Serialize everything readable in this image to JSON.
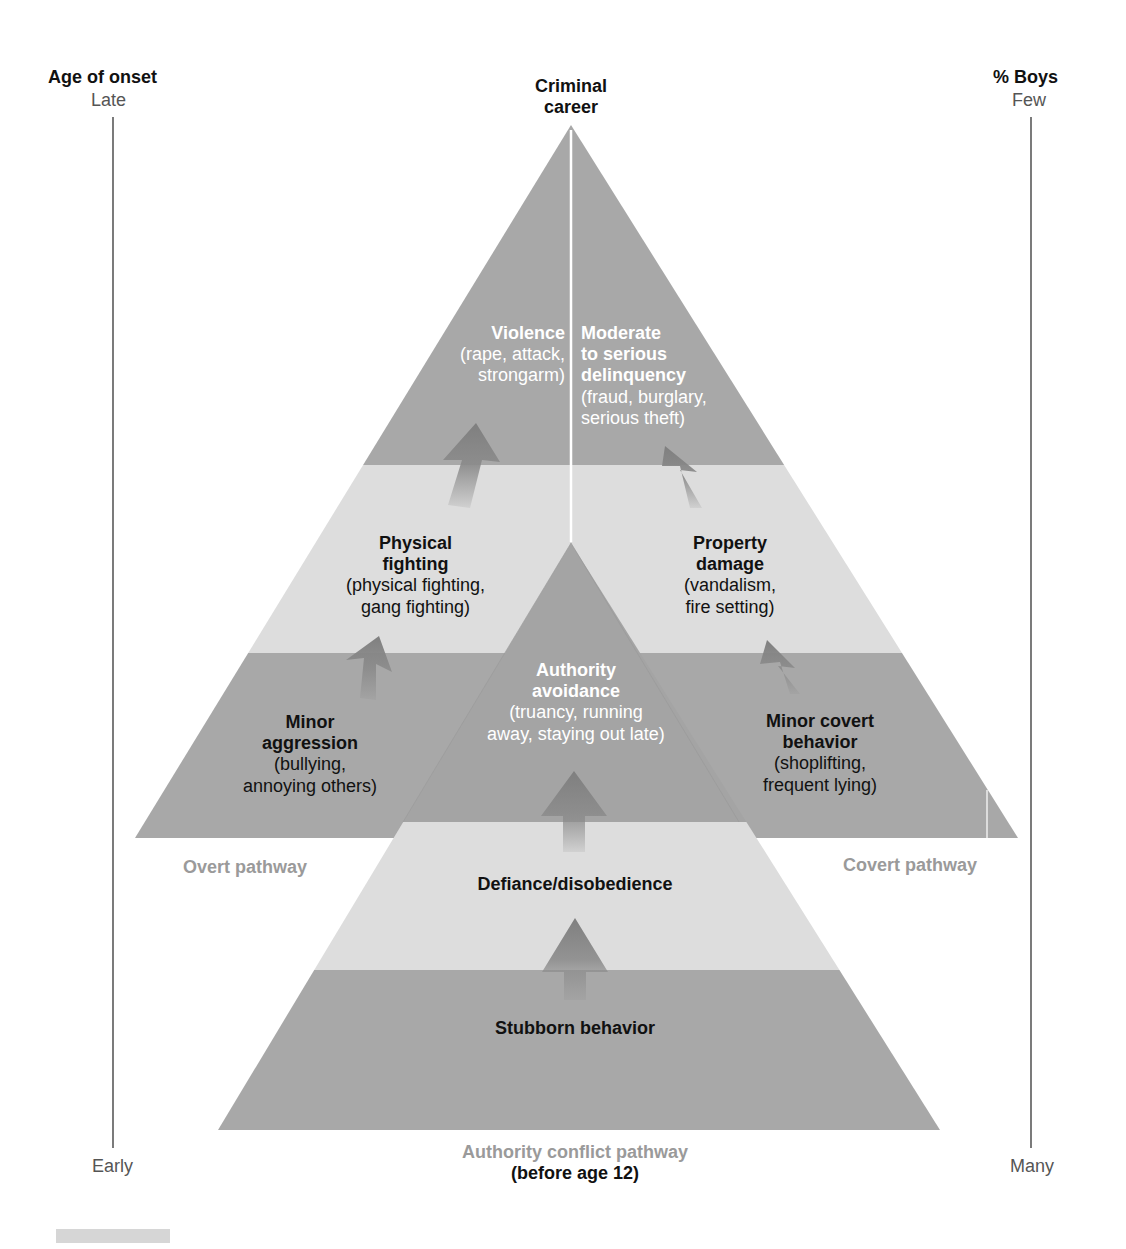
{
  "axes": {
    "left": {
      "title": "Age of onset",
      "top": "Late",
      "bottom": "Early"
    },
    "right": {
      "title": "% Boys",
      "top": "Few",
      "bottom": "Many"
    }
  },
  "apex_label": [
    "Criminal",
    "career"
  ],
  "overt": {
    "pathway_label": "Overt pathway",
    "stages": [
      {
        "title": [
          "Violence"
        ],
        "detail": [
          "(rape, attack,",
          "strongarm)"
        ]
      },
      {
        "title": [
          "Physical",
          "fighting"
        ],
        "detail": [
          "(physical fighting,",
          "gang fighting)"
        ]
      },
      {
        "title": [
          "Minor",
          "aggression"
        ],
        "detail": [
          "(bullying,",
          "annoying others)"
        ]
      }
    ]
  },
  "covert": {
    "pathway_label": "Covert pathway",
    "stages": [
      {
        "title": [
          "Moderate",
          "to serious",
          "delinquency"
        ],
        "detail": [
          "(fraud, burglary,",
          "serious theft)"
        ]
      },
      {
        "title": [
          "Property",
          "damage"
        ],
        "detail": [
          "(vandalism,",
          "fire setting)"
        ]
      },
      {
        "title": [
          "Minor covert",
          "behavior"
        ],
        "detail": [
          "(shoplifting,",
          "frequent lying)"
        ]
      }
    ]
  },
  "authority": {
    "pathway_label": "Authority conflict pathway",
    "pathway_sub": "(before age 12)",
    "stages": [
      {
        "title": [
          "Authority",
          "avoidance"
        ],
        "detail": [
          "(truancy, running",
          "away, staying out late)"
        ]
      },
      {
        "title": [
          "Defiance/disobedience"
        ]
      },
      {
        "title": [
          "Stubborn behavior"
        ]
      }
    ]
  },
  "colors": {
    "dark_band": "#a8a8a8",
    "light_band": "#dddddd",
    "arrow": "#8a8a8a"
  }
}
